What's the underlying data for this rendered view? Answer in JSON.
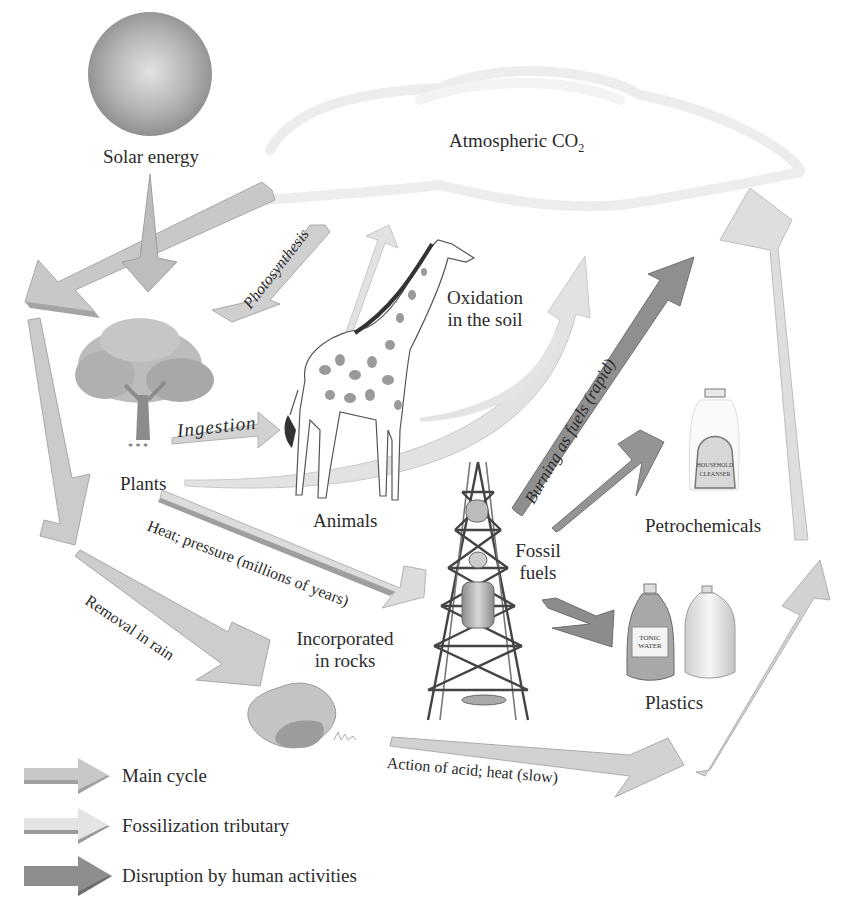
{
  "diagram": {
    "type": "flow-diagram"
  },
  "nodes": {
    "solar": {
      "label": "Solar energy",
      "icon": "sun-icon"
    },
    "atmosphere": {
      "label": "Atmospheric CO",
      "subscript": "2",
      "icon": "cloud-icon"
    },
    "plants": {
      "label": "Plants",
      "icon": "tree-icon"
    },
    "animals": {
      "label": "Animals",
      "icon": "giraffe-icon"
    },
    "fossil": {
      "line1": "Fossil",
      "line2": "fuels",
      "icon": "oil-derrick-icon"
    },
    "petro": {
      "label": "Petrochemicals",
      "icon": "cleanser-bottle-icon",
      "bottle_label_1": "HOUSEHOLD",
      "bottle_label_2": "CLEANSER"
    },
    "plastics": {
      "label": "Plastics",
      "icon": "plastic-bottles-icon",
      "bottle_label_1": "TONIC",
      "bottle_label_2": "WATER"
    },
    "rocks": {
      "line1": "Incorporated",
      "line2": "in rocks",
      "icon": "rock-icon"
    },
    "oxidation": {
      "line1": "Oxidation",
      "line2": "in the soil"
    }
  },
  "arrow_labels": {
    "photosynthesis": "Photosynthesis",
    "ingestion": "Ingestion",
    "burning": "Burning as fuels (rapid)",
    "heat_pressure": "Heat; pressure (millions of years)",
    "removal_rain": "Removal in rain",
    "acid_heat": "Action of acid; heat (slow)"
  },
  "legend": {
    "items": [
      {
        "label": "Main cycle",
        "color": "#c4c4c4",
        "edge": "#a0a0a0"
      },
      {
        "label": "Fossilization tributary",
        "color": "#e4e4e4",
        "edge": "#9a9a9a"
      },
      {
        "label": "Disruption by human activities",
        "color": "#8e8e8e",
        "edge": "#6e6e6e"
      }
    ]
  },
  "colors": {
    "main": "#c8c8c8",
    "main_edge": "#a2a2a2",
    "tributary": "#e2e2e2",
    "tributary_edge": "#b5b5b5",
    "human": "#8f8f8f",
    "human_edge": "#6a6a6a"
  }
}
